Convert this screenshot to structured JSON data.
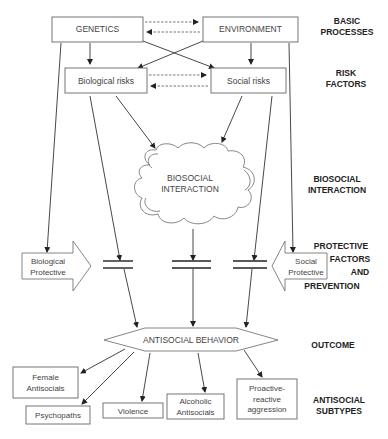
{
  "nodes": {
    "genetics": "GENETICS",
    "environment": "ENVIRONMENT",
    "biological_risks": "Biological risks",
    "social_risks": "Social risks",
    "biosocial_line1": "BIOSOCIAL",
    "biosocial_line2": "INTERACTION",
    "bio_protective_line1": "Biological",
    "bio_protective_line2": "Protective",
    "social_protective_line1": "Social",
    "social_protective_line2": "Protective",
    "antisocial_behavior": "ANTISOCIAL BEHAVIOR",
    "female_line1": "Female",
    "female_line2": "Antisocials",
    "psychopaths": "Psychopaths",
    "violence": "Violence",
    "alcoholic_line1": "Alcoholic",
    "alcoholic_line2": "Antisocials",
    "proactive_line1": "Proactive-",
    "proactive_line2": "reactive",
    "proactive_line3": "aggression"
  },
  "stages": {
    "basic_1": "BASIC",
    "basic_2": "PROCESSES",
    "risk_1": "RISK",
    "risk_2": "FACTORS",
    "bio_1": "BIOSOCIAL",
    "bio_2": "INTERACTION",
    "prot_1": "PROTECTIVE",
    "prot_2": "FACTORS",
    "prot_3": "AND",
    "prot_4": "PREVENTION",
    "outcome": "OUTCOME",
    "sub_1": "ANTISOCIAL",
    "sub_2": "SUBTYPES"
  }
}
